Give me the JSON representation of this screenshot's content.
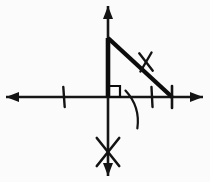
{
  "figure": {
    "title": "Right triangle on coordinate axes",
    "background_color": "#fbfbfb",
    "ink_color": "#131313",
    "canvas": {
      "width": 210,
      "height": 182
    },
    "origin": {
      "x": 108,
      "y": 97
    },
    "axes": {
      "x_axis": {
        "label": "x-axis",
        "y": 97,
        "x_start": 6,
        "x_end": 203,
        "stroke_width": 2.6,
        "arrow_left": true,
        "arrow_right": true
      },
      "y_axis": {
        "label": "y-axis",
        "x": 108,
        "y_start": 6,
        "y_end": 176,
        "stroke_width": 2.6,
        "arrow_up": true,
        "arrow_down": true
      },
      "arrowhead": {
        "length": 13,
        "half_width": 5
      }
    },
    "triangle": {
      "label": "right triangle",
      "vertices": [
        {
          "name": "apex",
          "x": 108,
          "y": 38
        },
        {
          "name": "right-angle-vertex",
          "x": 108,
          "y": 97
        },
        {
          "name": "base-vertex",
          "x": 171,
          "y": 97
        }
      ],
      "vertical_leg": {
        "x": 108,
        "y_top": 38,
        "y_bottom": 97,
        "stroke_width": 4.6
      },
      "hypotenuse": {
        "x1": 108,
        "y1": 38,
        "x2": 172,
        "y2": 97,
        "stroke_width": 4.4
      },
      "base_leg_on_axis": true
    },
    "right_angle_square": {
      "label": "right angle marker",
      "x": 109,
      "y": 86,
      "size": 11,
      "stroke_width": 2.2
    },
    "angle_arc": {
      "label": "angle arc at base vertex",
      "center_x": 171,
      "center_y": 97,
      "radius": 46,
      "start_angle_deg": 188,
      "end_angle_deg": 137,
      "stroke_width": 2.2
    },
    "tick_marks": [
      {
        "name": "x-axis-tick-negative",
        "kind": "single-hash",
        "x": 64,
        "y": 97,
        "half_length": 10,
        "stroke_width": 2.4,
        "tilt_deg": 4
      },
      {
        "name": "x-axis-tick-positive-inner",
        "kind": "single-hash",
        "x": 152,
        "y": 97,
        "half_length": 10,
        "stroke_width": 2.4,
        "tilt_deg": 3
      },
      {
        "name": "x-axis-tick-at-base-vertex",
        "kind": "single-hash",
        "x": 172,
        "y": 97,
        "half_length": 11,
        "stroke_width": 2.6,
        "tilt_deg": 0
      },
      {
        "name": "hypotenuse-hash",
        "kind": "cross-hash",
        "x": 146,
        "y": 62,
        "half_length": 11,
        "stroke_width": 2.4,
        "tilt_deg": 38
      }
    ],
    "cross_mark": {
      "name": "x-mark-on-negative-y-axis",
      "label": "X mark",
      "x": 108,
      "y": 152,
      "arm_length": 14,
      "stroke_width": 2.6
    }
  }
}
